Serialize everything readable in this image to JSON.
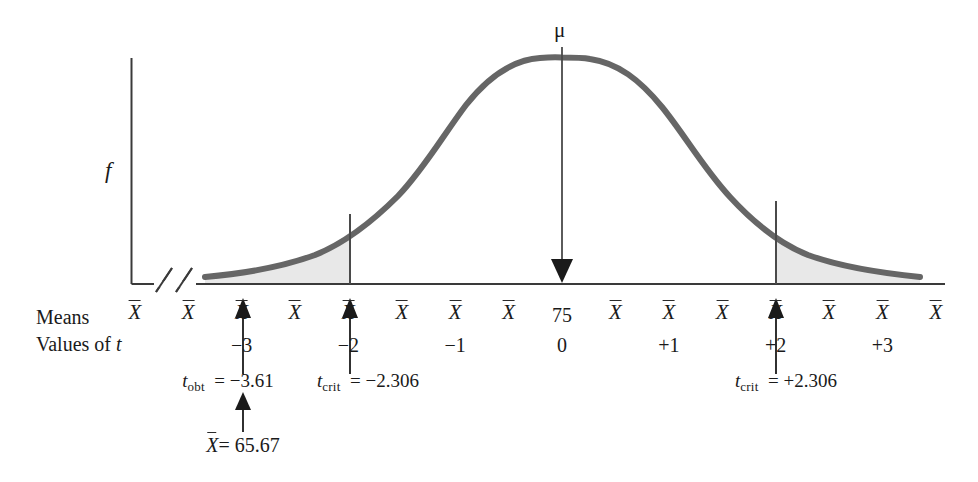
{
  "figure": {
    "type": "sampling-distribution",
    "curve_color": "#666666",
    "shade_color": "#e8e8e8",
    "axis_color": "#3a3a3a",
    "y_axis_label": "f",
    "center_label": "μ",
    "center_value": "75",
    "row_labels": {
      "means": "Means",
      "values_of_t": "Values of t"
    },
    "mean_symbol": "X",
    "x_tick_symbols": [
      "X",
      "X",
      "X",
      "X",
      "X",
      "X",
      "X",
      "X",
      "75",
      "X",
      "X",
      "X",
      "X",
      "X",
      "X",
      "X",
      "X"
    ],
    "t_values": [
      "-3",
      "-2",
      "-1",
      "0",
      "+1",
      "+2",
      "+3"
    ],
    "annotations": [
      {
        "name": "t-obt",
        "text_prefix": "t",
        "subscript": "obt",
        "text_suffix": "= −3.61",
        "t_value": -3.61
      },
      {
        "name": "t-crit-left",
        "text_prefix": "t",
        "subscript": "crit",
        "text_suffix": "= −2.306",
        "t_value": -2.306
      },
      {
        "name": "t-crit-right",
        "text_prefix": "t",
        "subscript": "crit",
        "text_suffix": "= +2.306",
        "t_value": 2.306
      }
    ],
    "sample_mean_note": {
      "symbol": "X",
      "text": "= 65.67",
      "value": 65.67
    }
  },
  "chart_data": {
    "type": "line",
    "title": "",
    "xlabel": "Values of t",
    "ylabel": "f",
    "x": [
      -3.6,
      -3.3,
      -3.0,
      -2.7,
      -2.4,
      -2.1,
      -1.8,
      -1.5,
      -1.2,
      -0.9,
      -0.6,
      -0.3,
      0.0,
      0.3,
      0.6,
      0.9,
      1.2,
      1.5,
      1.8,
      2.1,
      2.4,
      2.7,
      3.0,
      3.3,
      3.6
    ],
    "values": [
      0.012,
      0.018,
      0.027,
      0.042,
      0.065,
      0.099,
      0.147,
      0.212,
      0.295,
      0.392,
      0.494,
      0.585,
      0.64,
      0.585,
      0.494,
      0.392,
      0.295,
      0.212,
      0.147,
      0.099,
      0.065,
      0.042,
      0.027,
      0.018,
      0.012
    ],
    "xlim": [
      -3.8,
      3.8
    ],
    "ylim": [
      0,
      0.72
    ],
    "grid": false,
    "legend": false,
    "tick_labels": [
      "-3",
      "-2",
      "-1",
      "0",
      "+1",
      "+2",
      "+3"
    ],
    "annotations": [
      {
        "label": "t_obt = -3.61",
        "x": -3.61
      },
      {
        "label": "t_crit = -2.306",
        "x": -2.306
      },
      {
        "label": "t_crit = +2.306",
        "x": 2.306
      },
      {
        "label": "mu",
        "x": 0
      },
      {
        "label": "X-bar = 65.67",
        "x": -3.61
      }
    ],
    "shaded_regions": [
      {
        "name": "lower-rejection-region",
        "from": -3.8,
        "to": -2.306
      },
      {
        "name": "upper-rejection-region",
        "from": 2.306,
        "to": 3.8
      }
    ]
  }
}
